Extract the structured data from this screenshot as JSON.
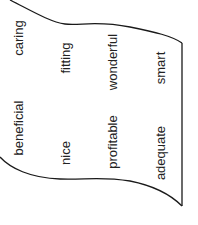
{
  "diagram": {
    "shape": "wavy-flag",
    "stroke_color": "#1a1a1a",
    "words": [
      {
        "text": "caring",
        "x": 18,
        "y": 38
      },
      {
        "text": "beneficial",
        "x": 18,
        "y": 128
      },
      {
        "text": "fitting",
        "x": 65,
        "y": 58
      },
      {
        "text": "nice",
        "x": 65,
        "y": 153
      },
      {
        "text": "wonderful",
        "x": 112,
        "y": 62
      },
      {
        "text": "profitable",
        "x": 112,
        "y": 142
      },
      {
        "text": "smart",
        "x": 160,
        "y": 68
      },
      {
        "text": "adequate",
        "x": 160,
        "y": 153
      }
    ]
  }
}
